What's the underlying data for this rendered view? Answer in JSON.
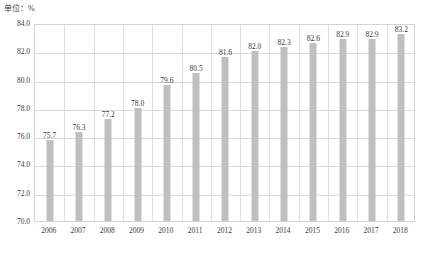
{
  "chart_data": {
    "type": "bar",
    "title": "",
    "subtitle": "",
    "unit_label": "单位：%",
    "xlabel": "",
    "ylabel": "",
    "ylim": [
      70.0,
      84.0
    ],
    "ystep": 2.0,
    "ytick_labels": [
      "84.0",
      "82.0",
      "80.0",
      "78.0",
      "76.0",
      "74.0",
      "72.0",
      "70.0"
    ],
    "ytick_values": [
      84.0,
      82.0,
      80.0,
      78.0,
      76.0,
      74.0,
      72.0,
      70.0
    ],
    "grid": true,
    "legend": "none",
    "categories": [
      "2006",
      "2007",
      "2008",
      "2009",
      "2010",
      "2011",
      "2012",
      "2013",
      "2014",
      "2015",
      "2016",
      "2017",
      "2018"
    ],
    "values": [
      75.7,
      76.3,
      77.2,
      78.0,
      79.6,
      80.5,
      81.6,
      82.0,
      82.3,
      82.6,
      82.9,
      82.9,
      83.2
    ],
    "data_labels": [
      "75.7",
      "76.3",
      "77.2",
      "78.0",
      "79.6",
      "80.5",
      "81.6",
      "82.0",
      "82.3",
      "82.6",
      "82.9",
      "82.9",
      "83.2"
    ],
    "series": [
      {
        "name": "",
        "color": "#bfbfbf",
        "values": [
          75.7,
          76.3,
          77.2,
          78.0,
          79.6,
          80.5,
          81.6,
          82.0,
          82.3,
          82.6,
          82.9,
          82.9,
          83.2
        ]
      }
    ]
  },
  "caption": {
    "text": ""
  },
  "colors": {
    "bar": "#bfbfbf",
    "grid": "#d9d9d9",
    "frame": "#d4d4d4",
    "text": "#3a3a3a",
    "background": "#ffffff"
  }
}
